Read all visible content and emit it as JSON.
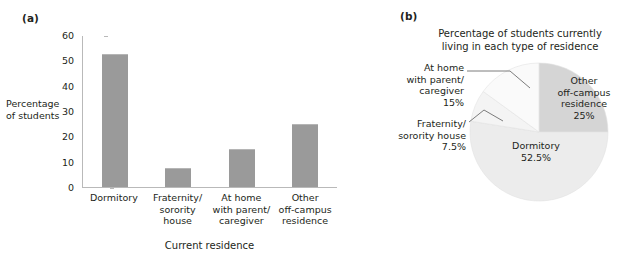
{
  "figure": {
    "panel_a_label": "(a)",
    "panel_b_label": "(b)"
  },
  "chart_data": [
    {
      "type": "bar",
      "panel": "(a)",
      "title": "",
      "xlabel": "Current residence",
      "ylabel": "Percentage of students",
      "ylim": [
        0,
        60
      ],
      "yticks": [
        "0",
        "10",
        "20",
        "30",
        "40",
        "50",
        "60"
      ],
      "grid": false,
      "legend": "none",
      "bar_color": "#9a9a9a",
      "categories": [
        "Dormitory",
        "Fraternity/\nsorority\nhouse",
        "At home\nwith parent/\ncaregiver",
        "Other\noff-campus\nresidence"
      ],
      "category_lines": [
        [
          "Dormitory"
        ],
        [
          "Fraternity/",
          "sorority",
          "house"
        ],
        [
          "At home",
          "with parent/",
          "caregiver"
        ],
        [
          "Other",
          "off-campus",
          "residence"
        ]
      ],
      "values": [
        52.5,
        7.5,
        15,
        25
      ]
    },
    {
      "type": "pie",
      "panel": "(b)",
      "title_lines": [
        "Percentage of students currently",
        "living in each type of residence"
      ],
      "legend": "labels on slices and leader-line callouts",
      "slices": [
        {
          "label_lines": [
            "Other",
            "off-campus",
            "residence"
          ],
          "value": 25,
          "value_label": "25%",
          "color": "#d5d5d5",
          "placement": "inside"
        },
        {
          "label_lines": [
            "Dormitory"
          ],
          "value": 52.5,
          "value_label": "52.5%",
          "color": "#ececec",
          "placement": "inside"
        },
        {
          "label_lines": [
            "Fraternity/",
            "sorority house"
          ],
          "value": 7.5,
          "value_label": "7.5%",
          "color": "#f4f4f4",
          "placement": "callout-left"
        },
        {
          "label_lines": [
            "At home",
            "with parent/",
            "caregiver"
          ],
          "value": 15,
          "value_label": "15%",
          "color": "#fafafa",
          "placement": "callout-left"
        }
      ]
    }
  ],
  "bar_chart": {
    "ylabel_line1": "Percentage",
    "ylabel_line2": "of students",
    "xlabel": "Current residence",
    "yticks": [
      "60",
      "50",
      "40",
      "30",
      "20",
      "10",
      "0"
    ],
    "cats": [
      {
        "l1": "Dormitory",
        "l2": "",
        "l3": ""
      },
      {
        "l1": "Fraternity/",
        "l2": "sorority",
        "l3": "house"
      },
      {
        "l1": "At home",
        "l2": "with parent/",
        "l3": "caregiver"
      },
      {
        "l1": "Other",
        "l2": "off-campus",
        "l3": "residence"
      }
    ]
  },
  "pie_chart": {
    "title_l1": "Percentage of students currently",
    "title_l2": "living in each type of residence",
    "other": {
      "l1": "Other",
      "l2": "off-campus",
      "l3": "residence",
      "pct": "25%"
    },
    "dormitory": {
      "l1": "Dormitory",
      "pct": "52.5%"
    },
    "athome": {
      "l1": "At home",
      "l2": "with parent/",
      "l3": "caregiver",
      "pct": "15%"
    },
    "frat": {
      "l1": "Fraternity/",
      "l2": "sorority house",
      "pct": "7.5%"
    }
  }
}
